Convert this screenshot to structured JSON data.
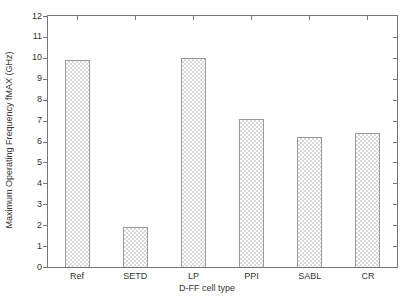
{
  "figure": {
    "background": "#ffffff",
    "frame_color": "#777777",
    "text_color": "#333333",
    "bar_border_color": "#9a9a9a",
    "bar_pattern_color": "#d9d9d9"
  },
  "chart_data": {
    "type": "bar",
    "title": "",
    "xlabel": "D-FF cell type",
    "ylabel": "Maximum Operating Frequency fMAX (GHz)",
    "categories": [
      "Ref",
      "SETD",
      "LP",
      "PPI",
      "SABL",
      "CR"
    ],
    "values": [
      9.9,
      1.9,
      10.0,
      7.1,
      6.2,
      6.4
    ],
    "ylim": [
      0,
      12
    ],
    "yticks": [
      0,
      1,
      2,
      3,
      4,
      5,
      6,
      7,
      8,
      9,
      10,
      11,
      12
    ],
    "ytick_step": 1,
    "grid": false,
    "legend": "none",
    "bar_fill": "checkerboard-pattern"
  }
}
